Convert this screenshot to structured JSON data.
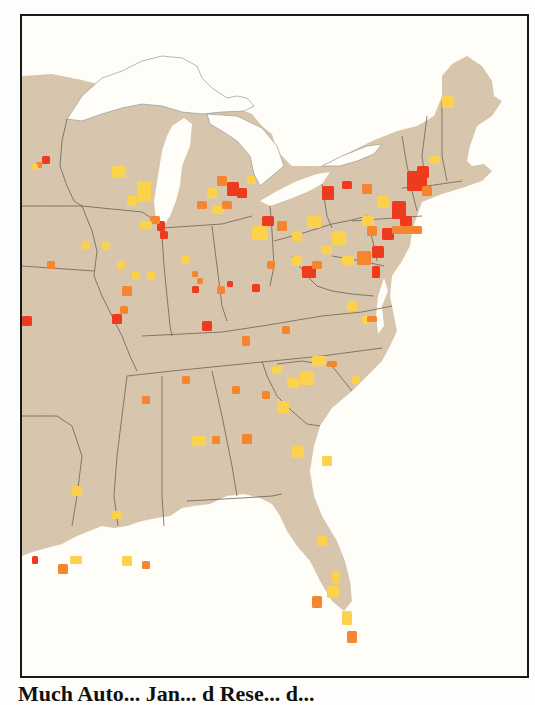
{
  "map": {
    "title": "Eastern United States county map",
    "colors": {
      "land": "#d8c7ae",
      "water": "#fffdf8",
      "state_border": "#6b6255",
      "lake_outline": "#9a9a9a",
      "frame": "#1a1a1a"
    },
    "classes": [
      {
        "id": "low",
        "color": "#fcd24a"
      },
      {
        "id": "medium",
        "color": "#f7a445"
      },
      {
        "id": "high",
        "color": "#f5852f"
      },
      {
        "id": "highest",
        "color": "#ee3a1e"
      }
    ],
    "regions_shown": [
      "Minnesota",
      "Wisconsin",
      "Michigan",
      "Iowa",
      "Illinois",
      "Indiana",
      "Ohio",
      "Missouri",
      "Kentucky",
      "Tennessee",
      "Arkansas",
      "Louisiana",
      "Mississippi",
      "Alabama",
      "Georgia",
      "Florida",
      "South Carolina",
      "North Carolina",
      "Virginia",
      "West Virginia",
      "Maryland",
      "Delaware",
      "Pennsylvania",
      "New Jersey",
      "New York",
      "Connecticut",
      "Rhode Island",
      "Massachusetts",
      "Vermont",
      "New Hampshire",
      "Maine"
    ]
  },
  "caption": {
    "text": "Much Auto... Jan... d Rese... d..."
  }
}
